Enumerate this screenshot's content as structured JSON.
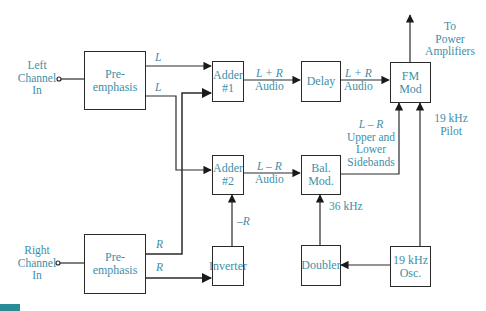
{
  "diagram": {
    "inputs": {
      "left": {
        "line1": "Left",
        "line2": "Channel",
        "line3": "In"
      },
      "right": {
        "line1": "Right",
        "line2": "Channel",
        "line3": "In"
      }
    },
    "blocks": {
      "pre_emphasis_left": "Pre-emphasis",
      "pre_emphasis_right": "Pre-emphasis",
      "adder1": {
        "line1": "Adder",
        "line2": "#1"
      },
      "adder2": {
        "line1": "Adder",
        "line2": "#2"
      },
      "delay": "Delay",
      "fm_mod": {
        "line1": "FM",
        "line2": "Mod"
      },
      "bal_mod": {
        "line1": "Bal.",
        "line2": "Mod."
      },
      "inverter": "Inverter",
      "doubler": "Doubler",
      "osc": {
        "line1": "19 kHz",
        "line2": "Osc."
      }
    },
    "signal_labels": {
      "l_top": "L",
      "l_bottom": "L",
      "r_top": "R",
      "r_bottom": "R",
      "neg_r": "–R",
      "sum_audio_1": {
        "line1": "L + R",
        "line2": "Audio"
      },
      "sum_audio_2": {
        "line1": "L + R",
        "line2": "Audio"
      },
      "diff_audio": {
        "line1": "L – R",
        "line2": "Audio"
      },
      "sidebands": {
        "line1": "L – R",
        "line2": "Upper and",
        "line3": "Lower",
        "line4": "Sidebands"
      },
      "pilot": {
        "line1": "19 kHz",
        "line2": "Pilot"
      },
      "doubled": "36 kHz",
      "output": {
        "line1": "To",
        "line2": "Power",
        "line3": "Amplifiers"
      }
    },
    "colors": {
      "text": "#3d8fa8",
      "line": "#2a2a2a",
      "accent_bar": "#2a8c96"
    }
  }
}
